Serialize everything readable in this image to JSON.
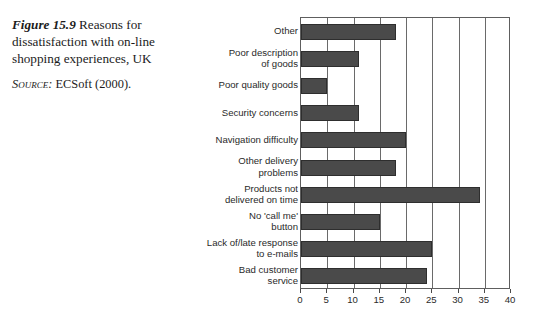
{
  "caption": {
    "figure_number": "Figure 15.9",
    "text": "Reasons for dissatisfaction with on-line shopping experiences, UK",
    "source_label": "Source:",
    "source_text": "ECSoft (2000)."
  },
  "chart_data": {
    "type": "bar",
    "orientation": "horizontal",
    "title": "",
    "xlabel": "",
    "ylabel": "",
    "xlim": [
      0,
      40
    ],
    "xticks": [
      0,
      5,
      10,
      15,
      20,
      25,
      30,
      35,
      40
    ],
    "xtick_labels": [
      "0",
      "5",
      "10",
      "15",
      "20",
      "25",
      "30",
      "35",
      "40"
    ],
    "grid": true,
    "grid_axis": "x",
    "legend": false,
    "bar_color": "#4a4a4a",
    "bar_edge_color": "#2e2e2e",
    "categories": [
      "Other",
      "Poor description\nof goods",
      "Poor quality goods",
      "Security concerns",
      "Navigation difficulty",
      "Other delivery\nproblems",
      "Products not\ndelivered on time",
      "No 'call me'\nbutton",
      "Lack of/late response\nto e-mails",
      "Bad customer\nservice"
    ],
    "values": [
      18,
      11,
      5,
      11,
      20,
      18,
      34,
      15,
      25,
      24
    ]
  }
}
